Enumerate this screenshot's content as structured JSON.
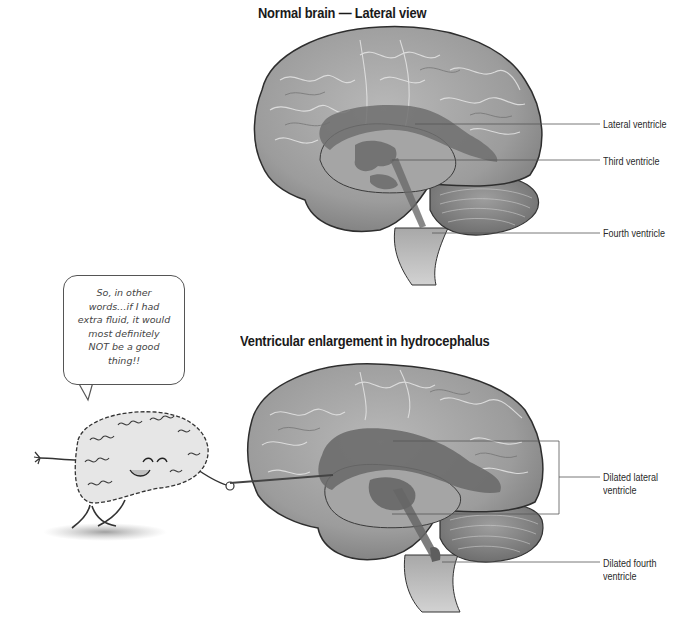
{
  "diagrams": [
    {
      "title": "Normal brain — Lateral view",
      "labels": [
        {
          "text": "Lateral ventricle"
        },
        {
          "text": "Third ventricle"
        },
        {
          "text": "Fourth ventricle"
        }
      ]
    },
    {
      "title": "Ventricular enlargement in hydrocephalus",
      "labels": [
        {
          "text": "Dilated lateral\nventricle",
          "line1": "Dilated lateral",
          "line2": "ventricle"
        },
        {
          "text": "Dilated fourth\nventricle",
          "line1": "Dilated fourth",
          "line2": "ventricle"
        }
      ]
    }
  ],
  "cartoon": {
    "speech": "So, in other words…if I had extra fluid, it would most definitely NOT be a good thing!!",
    "speech_lines": [
      "So, in other",
      "words…if I had",
      "extra fluid, it would",
      "most definitely",
      "NOT be a good",
      "thing!!"
    ]
  },
  "colors": {
    "brain_fill": "#9a9a9a",
    "brain_light": "#bdbdbd",
    "ventricle": "#6e6e6e",
    "outline": "#333333",
    "leader_line": "#555555"
  }
}
